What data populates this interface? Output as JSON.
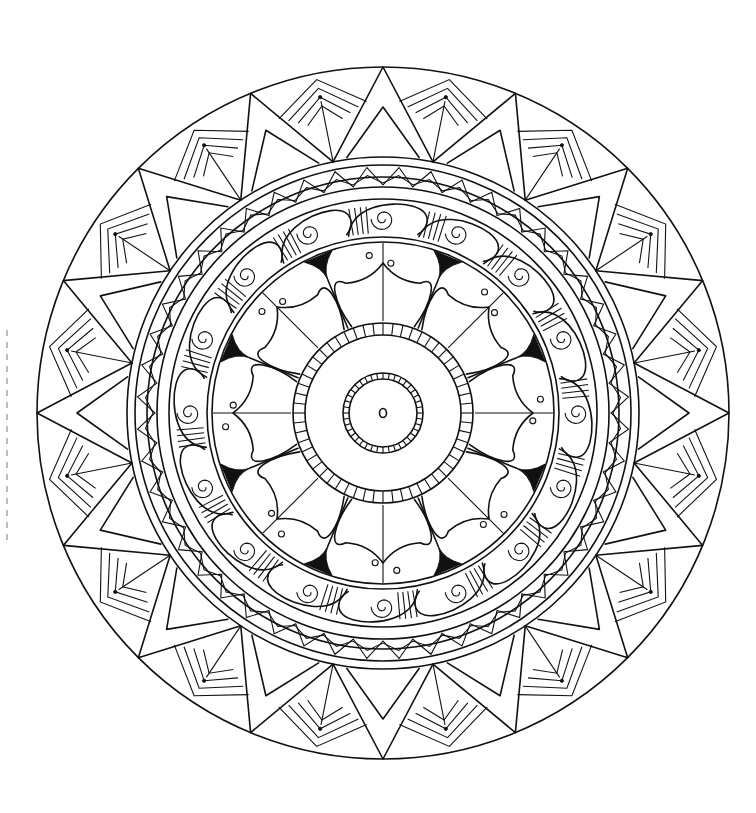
{
  "image": {
    "type": "mandala coloring page",
    "style": "black line art on white",
    "colors": {
      "line": "#111111",
      "background": "#ffffff"
    }
  },
  "mandala": {
    "outer_spikes": 16,
    "wave_swirls": 16,
    "petals": 8,
    "inner_ring_segments": 56,
    "core_ring_segments": 40
  }
}
